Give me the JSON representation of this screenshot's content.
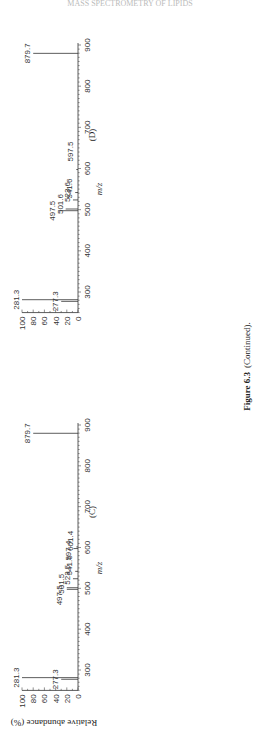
{
  "header": {
    "running_title": "MASS SPECTROMETRY OF LIPIDS"
  },
  "caption": {
    "label": "Figure 6.3",
    "text": "(Continued)."
  },
  "axes": {
    "ylabel": "Relative abundance (%)",
    "xlabel": "m/z",
    "yticks": [
      "0",
      "20",
      "40",
      "60",
      "80",
      "100"
    ],
    "xticks": [
      "300",
      "400",
      "500",
      "600",
      "700",
      "800",
      "900"
    ]
  },
  "chart_data": [
    {
      "type": "bar",
      "title": "(D)",
      "xlabel": "m/z",
      "ylabel": "Relative abundance (%)",
      "xlim": [
        250,
        900
      ],
      "ylim": [
        0,
        100
      ],
      "peaks": [
        {
          "mz": 277.3,
          "label": "277.3",
          "abundance": 30
        },
        {
          "mz": 281.3,
          "label": "281.3",
          "abundance": 100
        },
        {
          "mz": 497.5,
          "label": "497.5",
          "abundance": 35
        },
        {
          "mz": 501.6,
          "label": "501.6",
          "abundance": 22
        },
        {
          "mz": 523.6,
          "label": "523.6",
          "abundance": 9
        },
        {
          "mz": 541.6,
          "label": "541.6",
          "abundance": 5
        },
        {
          "mz": 597.5,
          "label": "597.5",
          "abundance": 3
        },
        {
          "mz": 879.7,
          "label": "879.7",
          "abundance": 80
        }
      ]
    },
    {
      "type": "bar",
      "title": "(C)",
      "xlabel": "m/z",
      "ylabel": "Relative abundance (%)",
      "xlim": [
        250,
        900
      ],
      "ylim": [
        0,
        100
      ],
      "peaks": [
        {
          "mz": 277.3,
          "label": "277.3",
          "abundance": 30
        },
        {
          "mz": 281.3,
          "label": "281.3",
          "abundance": 100
        },
        {
          "mz": 497.5,
          "label": "497.5",
          "abundance": 20
        },
        {
          "mz": 501.5,
          "label": "501.5",
          "abundance": 20
        },
        {
          "mz": 523.5,
          "label": "523.5",
          "abundance": 9
        },
        {
          "mz": 541.6,
          "label": "541.6",
          "abundance": 5
        },
        {
          "mz": 597.4,
          "label": "597.4",
          "abundance": 8
        },
        {
          "mz": 601.4,
          "label": "601.4",
          "abundance": 3
        },
        {
          "mz": 879.7,
          "label": "879.7",
          "abundance": 80
        }
      ]
    }
  ]
}
